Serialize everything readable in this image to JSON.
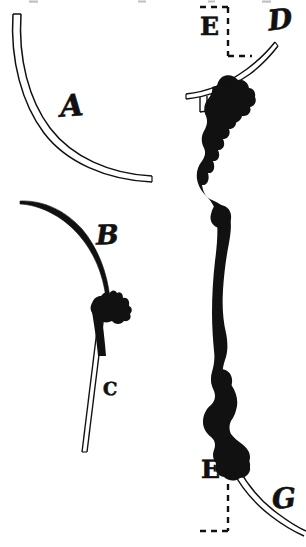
{
  "plate": {
    "width": 306,
    "height": 547,
    "background_color": "#ffffff",
    "ink_color": "#111111",
    "style": "antiquarian engraving line-art",
    "title": "Bow limb and nock detail plate"
  },
  "labels": [
    {
      "key": "A",
      "text": "A",
      "refers_to": "outlined-arc-upper-left",
      "x": 60,
      "y": 92
    },
    {
      "key": "B",
      "text": "B",
      "refers_to": "solid-black-curve-left",
      "x": 96,
      "y": 222
    },
    {
      "key": "C",
      "text": "c",
      "refers_to": "thin-double-line-shaft",
      "x": 103,
      "y": 374
    },
    {
      "key": "D",
      "text": "D",
      "refers_to": "outlined-arc-upper-right",
      "x": 268,
      "y": 6
    },
    {
      "key": "E1",
      "text": "E",
      "refers_to": "upper-dashed-bracket",
      "x": 200,
      "y": 14
    },
    {
      "key": "E2",
      "text": "E",
      "refers_to": "lower-dashed-bracket",
      "x": 201,
      "y": 457
    },
    {
      "key": "G",
      "text": "G",
      "refers_to": "outlined-arc-lower-right",
      "x": 272,
      "y": 485
    }
  ],
  "figures": {
    "arc_a": {
      "name": "Arc A",
      "rendering": "double-outline stroke",
      "note": "long sweeping arc from upper-left to lower-right"
    },
    "curve_b": {
      "name": "Curve B",
      "rendering": "solid tapering stroke",
      "note": "tapering limb ending at a black nock"
    },
    "shaft_c": {
      "name": "Shaft C",
      "rendering": "double-outline stroke",
      "note": "thin straight shaft descending from the nock"
    },
    "stave": {
      "name": "Main stave",
      "rendering": "solid irregular silhouette",
      "note": "tall sinuous black stave running the height of the plate"
    },
    "arc_d": {
      "name": "Arc D",
      "rendering": "double-outline stroke",
      "note": "arc sweeping up to the right across the upper nock"
    },
    "arc_g": {
      "name": "Arc G",
      "rendering": "double-outline stroke",
      "note": "arc sweeping down to the right from the lower nock"
    },
    "bracket_upper": {
      "name": "Upper dashed bracket",
      "rendering": "dashed right angle"
    },
    "bracket_lower": {
      "name": "Lower dashed bracket",
      "rendering": "dashed right angle"
    }
  },
  "artifacts": {
    "note": "faint scan speckles along the top margin"
  }
}
